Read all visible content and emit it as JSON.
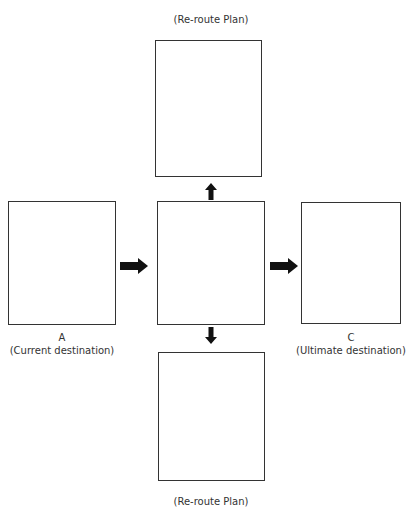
{
  "diagram": {
    "top_label": "(Re-route Plan)",
    "bottom_label": "(Re-route Plan)",
    "left_label": {
      "letter": "A",
      "caption": "(Current destination)"
    },
    "right_label": {
      "letter": "C",
      "caption": "(Ultimate destination)"
    },
    "boxes": [
      "top",
      "left",
      "center",
      "right",
      "bottom"
    ],
    "arrows": [
      "left-to-center",
      "center-to-right",
      "center-to-top",
      "center-to-bottom"
    ],
    "stroke_color": "#333333",
    "arrow_color": "#111111"
  }
}
